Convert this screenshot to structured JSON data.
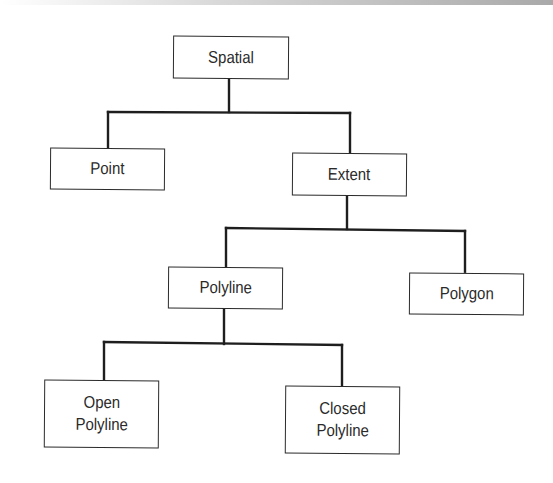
{
  "diagram": {
    "type": "hierarchy-tree",
    "nodes": {
      "spatial": {
        "label": "Spatial"
      },
      "point": {
        "label": "Point"
      },
      "extent": {
        "label": "Extent"
      },
      "polyline": {
        "label": "Polyline"
      },
      "polygon": {
        "label": "Polygon"
      },
      "open_polyline": {
        "label_line1": "Open",
        "label_line2": "Polyline"
      },
      "closed_polyline": {
        "label_line1": "Closed",
        "label_line2": "Polyline"
      }
    },
    "edges": [
      {
        "from": "Spatial",
        "to": "Point"
      },
      {
        "from": "Spatial",
        "to": "Extent"
      },
      {
        "from": "Extent",
        "to": "Polyline"
      },
      {
        "from": "Extent",
        "to": "Polygon"
      },
      {
        "from": "Polyline",
        "to": "Open Polyline"
      },
      {
        "from": "Polyline",
        "to": "Closed Polyline"
      }
    ],
    "colors": {
      "line": "#1e1e1e",
      "box_border": "#2b2b2b",
      "text": "#2a2a2a"
    }
  }
}
